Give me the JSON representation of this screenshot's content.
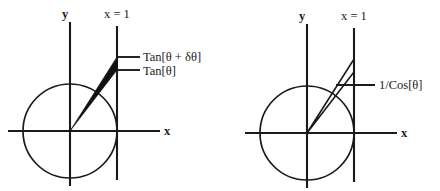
{
  "figure": {
    "background_color": "#ffffff",
    "ink_color": "#1a1a1a",
    "fill_color": "#111111"
  },
  "panels": [
    {
      "id": "left",
      "name": "tangent-increment-panel",
      "axis_labels": {
        "y": "y",
        "x": "x"
      },
      "vertical_line_label": "x = 1",
      "callouts": [
        {
          "id": "tan-theta-delta",
          "text": "Tan[θ + δθ]"
        },
        {
          "id": "tan-theta",
          "text": "Tan[θ]"
        }
      ],
      "geometry": {
        "origin": [
          70,
          131
        ],
        "circle_radius": 47,
        "x_axis": [
          8,
          131,
          160,
          131
        ],
        "y_axis": [
          70,
          22,
          70,
          186
        ],
        "vline_x": 117,
        "vline_top": 26,
        "vline_bottom": 180,
        "wedge_points": "70,131 117,57 117,70",
        "leaders": [
          {
            "x1": 117,
            "y1": 57,
            "x2": 140,
            "y2": 57
          },
          {
            "x1": 117,
            "y1": 70,
            "x2": 140,
            "y2": 70
          }
        ],
        "label_positions": {
          "y": [
            62,
            18
          ],
          "x": [
            164,
            135
          ],
          "vline": [
            104,
            18
          ],
          "callout_1": [
            143,
            61
          ],
          "callout_2": [
            143,
            75
          ]
        }
      }
    },
    {
      "id": "right",
      "name": "secant-panel",
      "axis_labels": {
        "y": "y",
        "x": "x"
      },
      "vertical_line_label": "x = 1",
      "callouts": [
        {
          "id": "one-over-cos-theta",
          "text": "1/Cos[θ]"
        }
      ],
      "geometry": {
        "origin": [
          307,
          133
        ],
        "circle_radius": 47,
        "x_axis": [
          245,
          133,
          397,
          133
        ],
        "y_axis": [
          307,
          24,
          307,
          188
        ],
        "vline_x": 354,
        "vline_top": 28,
        "vline_bottom": 182,
        "triangle_points": "307,133 354,59 354,72",
        "leaders": [
          {
            "x1": 336,
            "y1": 85,
            "x2": 375,
            "y2": 85
          }
        ],
        "label_positions": {
          "y": [
            299,
            20
          ],
          "x": [
            401,
            137
          ],
          "vline": [
            341,
            20
          ],
          "callout_1": [
            379,
            89
          ]
        }
      }
    }
  ]
}
